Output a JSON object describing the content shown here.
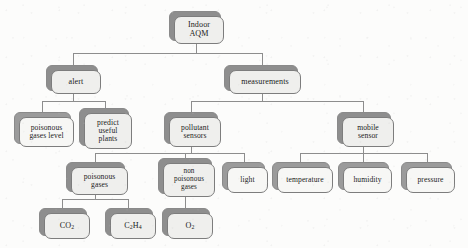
{
  "diagram": {
    "type": "hierarchy-tree",
    "background_color": "#fcfcfb",
    "node_fill_color": "#f7f7f5",
    "node_border_color": "#7d7d7d",
    "node_shadow_color": "#9b9b9b",
    "connector_color": "#8d8d8d",
    "levels": 5,
    "nodes": {
      "root": "Indoor\nAQM",
      "root_line1": "Indoor",
      "root_line2": "AQM",
      "alert": "alert",
      "measurements": "measurements",
      "poisonous_gases_level_l1": "poisonous",
      "poisonous_gases_level_l2": "gases level",
      "predict_l1": "predict",
      "predict_l2": "useful",
      "predict_l3": "plants",
      "pollutant_sensors_l1": "pollutant",
      "pollutant_sensors_l2": "sensors",
      "mobile_sensor_l1": "mobile",
      "mobile_sensor_l2": "sensor",
      "poisonous_gases_l1": "poisonous",
      "poisonous_gases_l2": "gases",
      "non_poisonous_gases_l1": "non",
      "non_poisonous_gases_l2": "poisonous",
      "non_poisonous_gases_l3": "gases",
      "light": "light",
      "temperature": "temperature",
      "humidity": "humidity",
      "pressure": "pressure",
      "co2_sym": "CO",
      "co2_sub": "2",
      "c2h4_sym1": "C",
      "c2h4_sub1": "2",
      "c2h4_sym2": "H",
      "c2h4_sub2": "4",
      "o2_sym": "O",
      "o2_sub": "2"
    },
    "edges": [
      {
        "from": "Indoor AQM",
        "to": "alert"
      },
      {
        "from": "Indoor AQM",
        "to": "measurements"
      },
      {
        "from": "alert",
        "to": "poisonous gases level"
      },
      {
        "from": "alert",
        "to": "predict useful plants"
      },
      {
        "from": "measurements",
        "to": "pollutant sensors"
      },
      {
        "from": "measurements",
        "to": "mobile sensor"
      },
      {
        "from": "pollutant sensors",
        "to": "poisonous gases"
      },
      {
        "from": "pollutant sensors",
        "to": "non poisonous gases"
      },
      {
        "from": "pollutant sensors",
        "to": "light"
      },
      {
        "from": "mobile sensor",
        "to": "temperature"
      },
      {
        "from": "mobile sensor",
        "to": "humidity"
      },
      {
        "from": "mobile sensor",
        "to": "pressure"
      },
      {
        "from": "poisonous gases",
        "to": "CO2"
      },
      {
        "from": "poisonous gases",
        "to": "C2H4"
      },
      {
        "from": "non poisonous gases",
        "to": "O2"
      }
    ]
  }
}
